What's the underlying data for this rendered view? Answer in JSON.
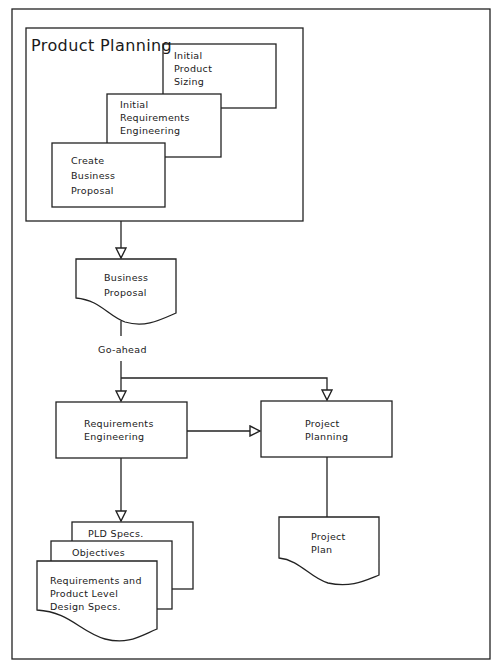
{
  "diagram": {
    "group": {
      "title": "Product Planning",
      "steps": [
        {
          "label": "Initial\nProduct\nSizing"
        },
        {
          "label": "Initial\nRequirements\nEngineering"
        },
        {
          "label": "Create\nBusiness\nProposal"
        }
      ]
    },
    "business_proposal": {
      "label": "Business\nProposal"
    },
    "decision_label": "Go-ahead",
    "requirements_engineering": {
      "label": "Requirements\nEngineering"
    },
    "project_planning": {
      "label": "Project\nPlanning"
    },
    "outputs": {
      "pld_specs": "PLD Specs.",
      "objectives": "Objectives",
      "req_specs": "Requirements and\nProduct Level\nDesign Specs.",
      "project_plan": "Project\nPlan"
    }
  },
  "colors": {
    "line": "#222222",
    "background": "#ffffff"
  }
}
